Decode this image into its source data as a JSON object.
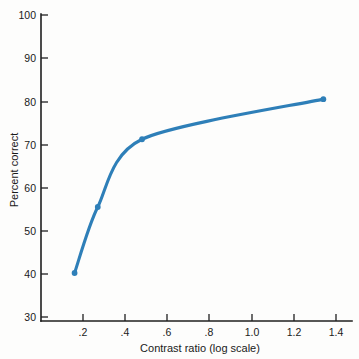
{
  "chart_data": {
    "type": "line",
    "title": "",
    "subtitle": "",
    "xlabel": "Contrast ratio (log scale)",
    "ylabel": "Percent correct",
    "xlim": [
      0.0,
      1.5
    ],
    "ylim": [
      30,
      100
    ],
    "grid": false,
    "legend": null,
    "series": [
      {
        "name": "Percent correct vs contrast ratio",
        "color": "#2E7FB8",
        "marker": "circle",
        "x": [
          0.16,
          0.27,
          0.48,
          1.34
        ],
        "y": [
          40.2,
          55.5,
          71.2,
          80.5
        ],
        "fit_curve": "smooth negatively accelerated curve through the four points"
      }
    ],
    "x_ticks": [
      {
        "value": 0.2,
        "label": ".2"
      },
      {
        "value": 0.4,
        "label": ".4"
      },
      {
        "value": 0.6,
        "label": ".6"
      },
      {
        "value": 0.8,
        "label": ".8"
      },
      {
        "value": 1.0,
        "label": "1.0"
      },
      {
        "value": 1.2,
        "label": "1.2"
      },
      {
        "value": 1.4,
        "label": "1.4"
      }
    ],
    "y_ticks": [
      {
        "value": 30,
        "label": "30"
      },
      {
        "value": 40,
        "label": "40"
      },
      {
        "value": 50,
        "label": "50"
      },
      {
        "value": 60,
        "label": "60"
      },
      {
        "value": 70,
        "label": "70"
      },
      {
        "value": 80,
        "label": "80"
      },
      {
        "value": 90,
        "label": "90"
      },
      {
        "value": 100,
        "label": "100"
      }
    ],
    "colors": {
      "curve": "#2E7FB8",
      "point": "#2E7FB8",
      "axis": "#1f1f1f",
      "background": "#fdfdfc",
      "text": "#1a1a1a"
    }
  }
}
